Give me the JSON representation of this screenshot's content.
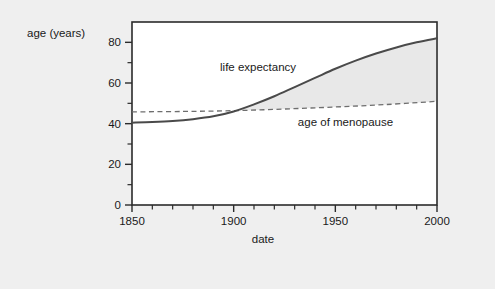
{
  "chart_data": {
    "type": "line",
    "title": "",
    "xlabel": "date",
    "ylabel": "age (years)",
    "xlim": [
      1850,
      2000
    ],
    "ylim": [
      0,
      90
    ],
    "grid": false,
    "legend_position": "inline-annotations",
    "x_major_ticks": [
      1850,
      1900,
      1950,
      2000
    ],
    "x_major_tick_labels": [
      "1850",
      "1900",
      "1950",
      "2000"
    ],
    "x_minor_tick_step": 10,
    "y_major_ticks": [
      0,
      20,
      40,
      60,
      80
    ],
    "y_major_tick_labels": [
      "0",
      "20",
      "40",
      "60",
      "80"
    ],
    "y_minor_ticks": [
      10,
      30,
      50,
      70
    ],
    "fill_between": {
      "series": [
        "life expectancy",
        "age of menopause"
      ],
      "from_x": 1900,
      "to_x": 2000,
      "color": "#e8e8e8"
    },
    "series": [
      {
        "name": "life expectancy",
        "style": "solid",
        "color": "#4a4a4a",
        "x": [
          1850,
          1860,
          1870,
          1880,
          1890,
          1900,
          1910,
          1920,
          1930,
          1940,
          1950,
          1960,
          1970,
          1980,
          1990,
          2000
        ],
        "values": [
          40.5,
          40.8,
          41.3,
          42.2,
          43.6,
          46.0,
          49.5,
          53.5,
          58.0,
          62.5,
          67.0,
          71.0,
          74.5,
          77.5,
          80.0,
          82.0
        ]
      },
      {
        "name": "age of menopause",
        "style": "dashed",
        "color": "#6e6e6e",
        "x": [
          1850,
          1875,
          1900,
          1925,
          1950,
          1975,
          2000
        ],
        "values": [
          45.8,
          46.0,
          46.4,
          47.2,
          48.2,
          49.4,
          51.0
        ]
      }
    ],
    "annotations": [
      {
        "name": "life-expectancy-label",
        "text": "life expectancy",
        "x": 1912,
        "y": 66
      },
      {
        "name": "age-of-menopause-label",
        "text": "age of menopause",
        "x": 1955,
        "y": 39
      }
    ]
  },
  "axes": {
    "y_axis_title": "age (years)",
    "x_axis_title": "date"
  },
  "colors": {
    "background": "#efefef",
    "plot_background": "#ffffff",
    "frame": "#2b2b2b",
    "fill": "#e8e8e8",
    "solid_curve": "#4a4a4a",
    "dashed_curve": "#6e6e6e",
    "text": "#1a1a1a"
  }
}
